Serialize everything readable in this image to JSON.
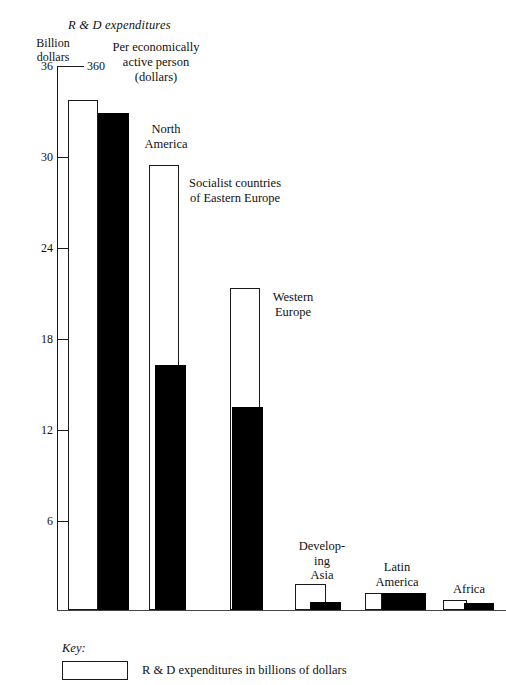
{
  "chart_data": {
    "type": "bar",
    "title": "R & D expenditures",
    "subtitle": "Per economically active person (dollars)",
    "categories": [
      "North America",
      "Socialist countries of Eastern Europe",
      "Western Europe",
      "Developing Asia",
      "Latin America",
      "Africa"
    ],
    "series": [
      {
        "name": "R & D expenditures in billions of dollars",
        "style": "open",
        "axis": "left",
        "unit": "Billion dollars",
        "values": [
          33.8,
          29.5,
          21.3,
          1.7,
          1.1,
          0.4
        ]
      },
      {
        "name": "Per economically active person (dollars)",
        "style": "solid",
        "axis": "right",
        "unit": "dollars",
        "values": [
          329,
          162,
          134,
          5,
          11,
          5
        ]
      }
    ],
    "left_axis": {
      "label": "Billion dollars",
      "ticks": [
        "6",
        "12",
        "18",
        "24",
        "30",
        "36"
      ],
      "ylim": [
        0,
        36
      ]
    },
    "right_axis": {
      "label": "Per economically active person (dollars)",
      "ticks": [
        "60",
        "120",
        "180",
        "240",
        "300",
        "360"
      ],
      "ylim": [
        0,
        360
      ]
    },
    "grid": false,
    "legend_position": "bottom-left"
  },
  "titles": {
    "rd_expenditures": "R & D expenditures",
    "left_axis_line1": "Billion",
    "left_axis_line2": "dollars",
    "right_axis_line1": "Per economically",
    "right_axis_line2": "active person",
    "right_axis_line3": "(dollars)"
  },
  "ticks": [
    {
      "left": "36",
      "right": "360",
      "y": 60
    },
    {
      "left": "30",
      "right": "300",
      "y": 151
    },
    {
      "left": "24",
      "right": "240",
      "y": 242
    },
    {
      "left": "18",
      "right": "180",
      "y": 333
    },
    {
      "left": "12",
      "right": "120",
      "y": 424
    },
    {
      "left": "6",
      "right": "60",
      "y": 515
    }
  ],
  "groups": [
    {
      "name": "North America",
      "label": "North\nAmerica",
      "label_left": 128,
      "label_top": 122,
      "label_width": 76,
      "open": {
        "x": 68,
        "w": 30,
        "top": 100
      },
      "solid": {
        "x": 98,
        "w": 31,
        "top": 113
      }
    },
    {
      "name": "Socialist countries of Eastern Europe",
      "label": "Socialist countries\nof Eastern Europe",
      "label_left": 170,
      "label_top": 176,
      "label_width": 130,
      "open": {
        "x": 149,
        "w": 30,
        "top": 165
      },
      "solid": {
        "x": 155,
        "w": 31,
        "top": 365
      }
    },
    {
      "name": "Western Europe",
      "label": "Western\nEurope",
      "label_left": 257,
      "label_top": 290,
      "label_width": 72,
      "open": {
        "x": 230,
        "w": 30,
        "top": 288
      },
      "solid": {
        "x": 232,
        "w": 31,
        "top": 407
      }
    },
    {
      "name": "Developing Asia",
      "label": "Develop-\ning\nAsia",
      "label_left": 291,
      "label_top": 539,
      "label_width": 62,
      "open": {
        "x": 295,
        "w": 31,
        "top": 584
      },
      "solid": {
        "x": 310,
        "w": 31,
        "top": 602
      }
    },
    {
      "name": "Latin America",
      "label": "Latin\nAmerica",
      "label_left": 361,
      "label_top": 560,
      "label_width": 72,
      "open": {
        "x": 365,
        "w": 17,
        "top": 593
      },
      "solid": {
        "x": 382,
        "w": 44,
        "top": 593
      }
    },
    {
      "name": "Africa",
      "label": "Africa",
      "label_left": 441,
      "label_top": 582,
      "label_width": 56,
      "open": {
        "x": 443,
        "w": 24,
        "top": 600
      },
      "solid": {
        "x": 464,
        "w": 30,
        "top": 603
      }
    }
  ],
  "key": {
    "title": "Key:",
    "entries": [
      {
        "style": "open",
        "text": "R & D expenditures in billions of dollars"
      }
    ]
  }
}
